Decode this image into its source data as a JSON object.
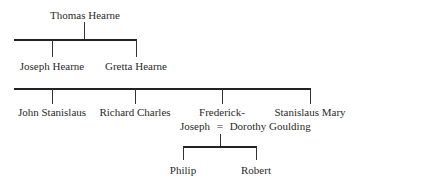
{
  "diagram": {
    "type": "family-tree",
    "generation1": {
      "parent": "Thomas Hearne",
      "children": [
        "Joseph Hearne",
        "Gretta Hearne"
      ]
    },
    "generation2": {
      "children": [
        "John Stanislaus",
        "Richard Charles",
        "Frederick-",
        "Stanislaus Mary"
      ],
      "marriage": {
        "husband_line2": "Joseph",
        "symbol": "=",
        "wife": "Dorothy Goulding"
      }
    },
    "generation3": {
      "children": [
        "Philip",
        "Robert"
      ]
    }
  }
}
